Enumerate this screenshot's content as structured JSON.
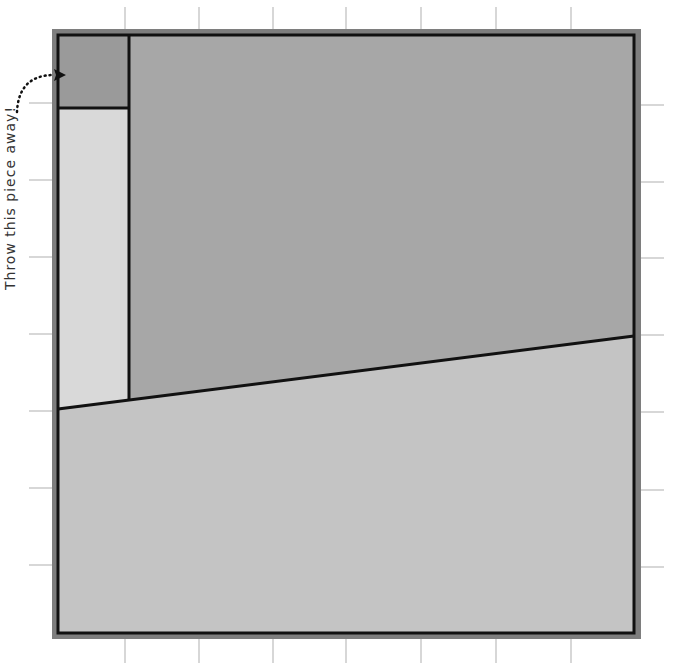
{
  "annotation": {
    "text": "Throw this piece away!",
    "arrow": "dotted-curved-arrow"
  },
  "colors": {
    "frame": "#7e7e7e",
    "border": "#111111",
    "corner_piece": "#9a9a9a",
    "upper_piece": "#a7a7a7",
    "left_strip": "#d9d9d9",
    "lower_piece": "#c4c4c4",
    "tick": "#bdbdbd"
  },
  "geometry": {
    "frame": {
      "x": 52,
      "y": 29,
      "w": 589,
      "h": 610
    },
    "inner": {
      "x": 58,
      "y": 35,
      "w": 576,
      "h": 598
    },
    "strip_right_x": 129,
    "corner_bottom_y": 108,
    "diagonal": {
      "x1": 58,
      "y1": 409,
      "x2": 634,
      "y2": 336
    },
    "top_ticks_x": [
      125,
      199,
      273,
      346,
      421,
      496,
      571
    ],
    "left_ticks_y": [
      103,
      180,
      257,
      334,
      411,
      488,
      565
    ],
    "right_ticks_y": [
      105,
      182,
      258,
      335,
      412,
      490,
      567
    ]
  }
}
